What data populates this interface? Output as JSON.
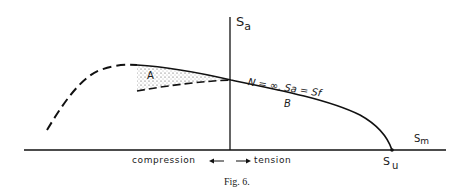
{
  "figure": {
    "caption": "Fig. 6.",
    "axes": {
      "y_label_main": "S",
      "y_label_sub": "a",
      "x_label_main": "S",
      "x_label_sub": "m",
      "su_main": "S",
      "su_sub": "u"
    },
    "regions": {
      "a": "A",
      "b": "B"
    },
    "curve_label": "N = ∞, Sa = Sf",
    "direction": {
      "compression": "compression",
      "tension": "tension",
      "left_arrow": "←",
      "right_arrow": "→"
    }
  }
}
